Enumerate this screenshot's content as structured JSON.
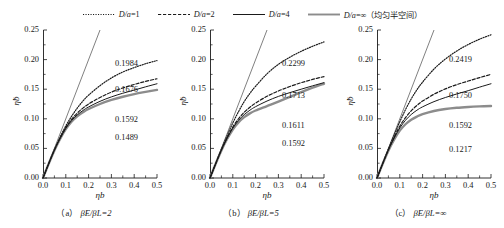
{
  "legend": {
    "position": "top-center",
    "items": [
      {
        "label": "D/a=1",
        "style": "dotted",
        "name": "legend-item-d-a-1"
      },
      {
        "label": "D/a=2",
        "style": "dashed",
        "name": "legend-item-d-a-2"
      },
      {
        "label": "D/a=4",
        "style": "solid-thin",
        "name": "legend-item-d-a-4"
      },
      {
        "label": "D/a=∞（均匀半空间）",
        "style": "solid-thick",
        "name": "legend-item-d-a-inf"
      }
    ]
  },
  "axes": {
    "xlabel": "ηb",
    "ylabel": "η̃b",
    "xticks": [
      "0.0",
      "0.1",
      "0.2",
      "0.3",
      "0.4",
      "0.5"
    ],
    "yticks": [
      "0.00",
      "0.05",
      "0.10",
      "0.15",
      "0.20",
      "0.25"
    ],
    "xlim": [
      0.0,
      0.5
    ],
    "ylim": [
      0.0,
      0.25
    ],
    "grid": false
  },
  "chart_data": [
    {
      "type": "line",
      "title": "（a）βE/βL=2",
      "caption_prefix": "（a）",
      "caption_body": "βE/βL=2",
      "xlabel": "ηb",
      "ylabel": "η̃b",
      "xlim": [
        0.0,
        0.5
      ],
      "ylim": [
        0.0,
        0.25
      ],
      "grid": false,
      "x": [
        0.0,
        0.025,
        0.05,
        0.075,
        0.1,
        0.125,
        0.15,
        0.175,
        0.2,
        0.25,
        0.3,
        0.35,
        0.4,
        0.45,
        0.5
      ],
      "reference_line": {
        "name": "elastic-reference-line",
        "x": [
          0.0,
          0.25
        ],
        "y": [
          0.0,
          0.25
        ]
      },
      "series": [
        {
          "name": "D/a=1",
          "style": "dotted",
          "end_label": "0.1984",
          "values": [
            0.0,
            0.0245,
            0.048,
            0.069,
            0.088,
            0.104,
            0.118,
            0.13,
            0.14,
            0.156,
            0.169,
            0.179,
            0.1865,
            0.193,
            0.1984
          ]
        },
        {
          "name": "D/a=2",
          "style": "dashed",
          "end_label": "0.1676",
          "values": [
            0.0,
            0.0243,
            0.0473,
            0.0675,
            0.085,
            0.099,
            0.1095,
            0.118,
            0.125,
            0.136,
            0.145,
            0.152,
            0.158,
            0.1632,
            0.1676
          ]
        },
        {
          "name": "D/a=4",
          "style": "solid-thin",
          "end_label": "0.1592",
          "values": [
            0.0,
            0.0242,
            0.047,
            0.0668,
            0.0838,
            0.0968,
            0.1065,
            0.114,
            0.12,
            0.1295,
            0.137,
            0.1432,
            0.1485,
            0.154,
            0.1592
          ]
        },
        {
          "name": "D/a=∞",
          "style": "solid-thick",
          "end_label": "0.1489",
          "values": [
            0.0,
            0.0241,
            0.0466,
            0.066,
            0.0825,
            0.095,
            0.1042,
            0.111,
            0.1165,
            0.125,
            0.1318,
            0.1372,
            0.1418,
            0.1455,
            0.1489
          ]
        }
      ],
      "end_labels": [
        "0.1984",
        "0.1676",
        "0.1592",
        "0.1489"
      ]
    },
    {
      "type": "line",
      "title": "（b）βE/βL=5",
      "caption_prefix": "（b）",
      "caption_body": "βE/βL=5",
      "xlabel": "ηb",
      "ylabel": "η̃b",
      "xlim": [
        0.0,
        0.5
      ],
      "ylim": [
        0.0,
        0.25
      ],
      "grid": false,
      "x": [
        0.0,
        0.025,
        0.05,
        0.075,
        0.1,
        0.125,
        0.15,
        0.175,
        0.2,
        0.25,
        0.3,
        0.35,
        0.4,
        0.45,
        0.5
      ],
      "reference_line": {
        "name": "elastic-reference-line",
        "x": [
          0.0,
          0.25
        ],
        "y": [
          0.0,
          0.25
        ]
      },
      "series": [
        {
          "name": "D/a=1",
          "style": "dotted",
          "end_label": "0.2299",
          "values": [
            0.0,
            0.0246,
            0.0487,
            0.0715,
            0.093,
            0.112,
            0.129,
            0.143,
            0.155,
            0.176,
            0.192,
            0.204,
            0.214,
            0.2225,
            0.2299
          ]
        },
        {
          "name": "D/a=2",
          "style": "dashed",
          "end_label": "0.1713",
          "values": [
            0.0,
            0.0243,
            0.0475,
            0.068,
            0.0862,
            0.1,
            0.111,
            0.1195,
            0.1265,
            0.138,
            0.147,
            0.1545,
            0.161,
            0.1665,
            0.1713
          ]
        },
        {
          "name": "D/a=4",
          "style": "solid-thin",
          "end_label": "0.1611",
          "values": [
            0.0,
            0.0242,
            0.0471,
            0.067,
            0.0842,
            0.0972,
            0.107,
            0.1145,
            0.1205,
            0.13,
            0.1378,
            0.1442,
            0.15,
            0.1557,
            0.1611
          ]
        },
        {
          "name": "D/a=∞",
          "style": "solid-thick",
          "end_label": "0.1592",
          "values": [
            0.0,
            0.0241,
            0.0466,
            0.0658,
            0.082,
            0.094,
            0.1028,
            0.1092,
            0.114,
            0.1215,
            0.129,
            0.137,
            0.145,
            0.1525,
            0.1592
          ]
        }
      ],
      "end_labels": [
        "0.2299",
        "0.1713",
        "0.1611",
        "0.1592"
      ]
    },
    {
      "type": "line",
      "title": "（c）βE/βL=∞",
      "caption_prefix": "（c）",
      "caption_body": "βE/βL=∞",
      "xlabel": "ηb",
      "ylabel": "η̃b",
      "xlim": [
        0.0,
        0.5
      ],
      "ylim": [
        0.0,
        0.25
      ],
      "grid": false,
      "x": [
        0.0,
        0.025,
        0.05,
        0.075,
        0.1,
        0.125,
        0.15,
        0.175,
        0.2,
        0.25,
        0.3,
        0.35,
        0.4,
        0.45,
        0.5
      ],
      "reference_line": {
        "name": "elastic-reference-line",
        "x": [
          0.0,
          0.25
        ],
        "y": [
          0.0,
          0.25
        ]
      },
      "series": [
        {
          "name": "D/a=1",
          "style": "dotted",
          "end_label": "0.2419",
          "values": [
            0.0,
            0.0247,
            0.049,
            0.0725,
            0.095,
            0.1155,
            0.1335,
            0.149,
            0.162,
            0.184,
            0.201,
            0.2145,
            0.2255,
            0.2345,
            0.2419
          ]
        },
        {
          "name": "D/a=2",
          "style": "dashed",
          "end_label": "0.1750",
          "values": [
            0.0,
            0.0244,
            0.0478,
            0.0688,
            0.0875,
            0.102,
            0.1135,
            0.1225,
            0.13,
            0.1415,
            0.1505,
            0.1577,
            0.1638,
            0.1696,
            0.175
          ]
        },
        {
          "name": "D/a=4",
          "style": "solid-thin",
          "end_label": "0.1592",
          "values": [
            0.0,
            0.0243,
            0.0472,
            0.0672,
            0.0845,
            0.0975,
            0.1072,
            0.1145,
            0.1202,
            0.129,
            0.136,
            0.142,
            0.1475,
            0.1535,
            0.1592
          ]
        },
        {
          "name": "D/a=∞",
          "style": "solid-thick",
          "end_label": "0.1217",
          "values": [
            0.0,
            0.024,
            0.0462,
            0.0648,
            0.08,
            0.0908,
            0.0985,
            0.1038,
            0.1078,
            0.1132,
            0.1165,
            0.1186,
            0.12,
            0.121,
            0.1217
          ]
        }
      ],
      "end_labels": [
        "0.2419",
        "0.1750",
        "0.1592",
        "0.1217"
      ]
    }
  ],
  "colors": {
    "axis": "#1a1a1a",
    "curve_dark": "#1a1a1a",
    "curve_gray": "#8c8c8c",
    "reference": "#555555",
    "background": "#ffffff"
  }
}
